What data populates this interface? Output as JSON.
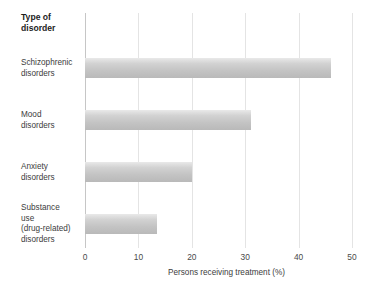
{
  "chart_data": {
    "type": "bar",
    "orientation": "horizontal",
    "title": "",
    "category_axis_heading": "Type of\ndisorder",
    "xlabel": "Persons receiving treatment (%)",
    "ylabel": "",
    "xlim": [
      0,
      50
    ],
    "xticks": [
      "0",
      "10",
      "20",
      "30",
      "40",
      "50"
    ],
    "grid": true,
    "legend": "none",
    "categories": [
      "Schizophrenic\ndisorders",
      "Mood\ndisorders",
      "Anxiety\ndisorders",
      "Substance\nuse\n(drug-related)\ndisorders"
    ],
    "values": [
      46,
      31,
      20,
      13.5
    ],
    "bar_color_top": "#e9e9e9",
    "bar_color_bottom": "#b9b9b9",
    "gridline_color": "#e4e4e4",
    "axis_color": "#c6c6c6"
  }
}
